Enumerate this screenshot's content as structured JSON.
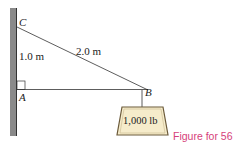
{
  "labels": {
    "point_c": "C",
    "point_a": "A",
    "point_b": "B",
    "vertical_length": "1.0 m",
    "diagonal_length": "2.0 m",
    "weight": "1,000 lb"
  },
  "caption": "Figure for 56",
  "colors": {
    "wall": "#8a8a8a",
    "lines": "#333333",
    "weight_fill": "#f6eccb",
    "weight_border": "#6b5a3a",
    "caption": "#d6417a"
  }
}
